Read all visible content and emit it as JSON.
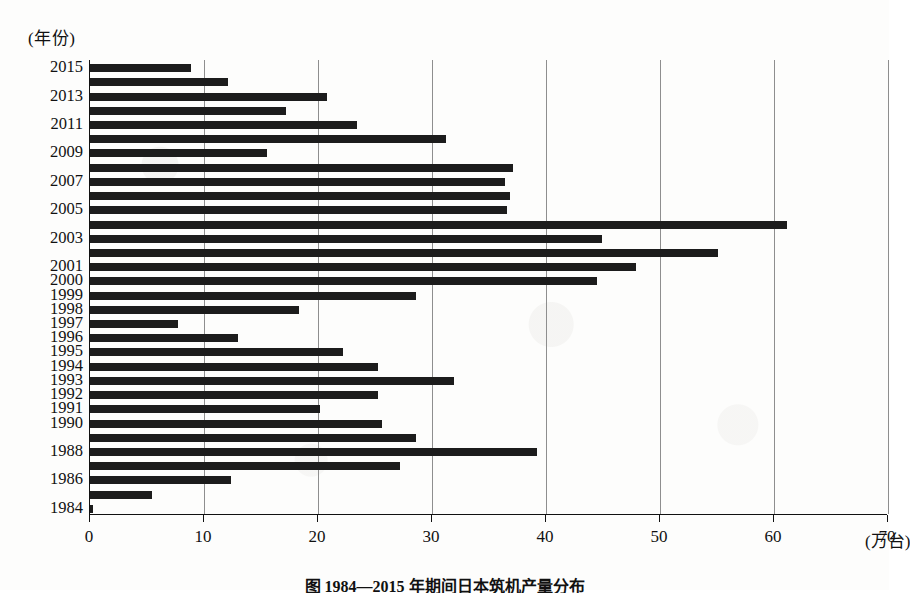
{
  "figure": {
    "y_axis_unit_label": "(年份)",
    "x_axis_unit_label": "(万台)",
    "caption": "图  1984—2015 年期间日本筑机产量分布"
  },
  "chart_data": {
    "type": "bar",
    "orientation": "horizontal",
    "title": "图  1984—2015 年期间日本筑机产量分布",
    "xlabel": "(万台)",
    "ylabel": "(年份)",
    "xlim": [
      0,
      70
    ],
    "xticks": [
      0,
      10,
      20,
      30,
      40,
      50,
      60,
      70
    ],
    "grid": "vertical",
    "legend": "none",
    "bar_color": "#1c1c1c",
    "categories": [
      "2015",
      "2014",
      "2013",
      "2012",
      "2011",
      "2010",
      "2009",
      "2008",
      "2007",
      "2006",
      "2005",
      "2004",
      "2003",
      "2002",
      "2001",
      "2000",
      "1999",
      "1998",
      "1997",
      "1996",
      "1995",
      "1994",
      "1993",
      "1992",
      "1991",
      "1990",
      "1989",
      "1988",
      "1987",
      "1986",
      "1985",
      "1984"
    ],
    "visible_tick_labels": [
      "2015",
      "2013",
      "2011",
      "2009",
      "2007",
      "2005",
      "2003",
      "2001",
      "2000",
      "1999",
      "1998",
      "1997",
      "1996",
      "1995",
      "1994",
      "1993",
      "1992",
      "1991",
      "1990",
      "1988",
      "1986",
      "1984"
    ],
    "values": [
      8.9,
      12.1,
      20.8,
      17.2,
      23.4,
      31.2,
      15.5,
      37.1,
      36.4,
      36.8,
      36.6,
      61.1,
      44.9,
      55.1,
      47.9,
      44.5,
      28.6,
      18.3,
      7.7,
      13.0,
      22.2,
      25.3,
      31.9,
      25.3,
      20.2,
      25.6,
      28.6,
      39.2,
      27.2,
      12.4,
      5.4,
      0.3
    ]
  }
}
